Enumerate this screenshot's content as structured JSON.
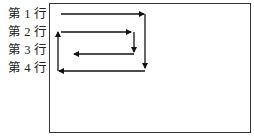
{
  "diagram": {
    "type": "scan-path",
    "rows": [
      {
        "label": "第 1 行"
      },
      {
        "label": "第 2 行"
      },
      {
        "label": "第 3 行"
      },
      {
        "label": "第 4 行"
      }
    ],
    "frame_color": "#333333",
    "arrow_color": "#111111"
  }
}
